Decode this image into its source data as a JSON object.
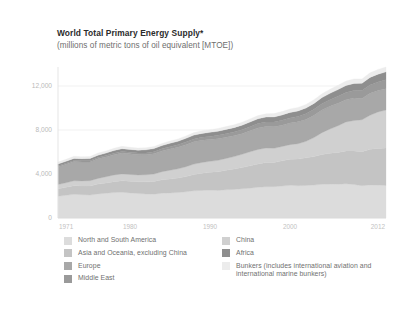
{
  "title": "World Total Primary Energy Supply*",
  "subtitle": "(millions of metric tons of oil equivalent [MTOE])",
  "legend": {
    "left": [
      {
        "label": "North and South America",
        "color": "#dcdcdc"
      },
      {
        "label": "Asia and Oceania, excluding China",
        "color": "#c4c4c4"
      },
      {
        "label": "Europe",
        "color": "#a8a8a8"
      },
      {
        "label": "Middle East",
        "color": "#9a9a9a"
      }
    ],
    "right": [
      {
        "label": "China",
        "color": "#d0d0d0"
      },
      {
        "label": "Africa",
        "color": "#8e8e8e"
      },
      {
        "label": "Bunkers (includes international aviation and international marine bunkers)",
        "color": "#ececec"
      }
    ]
  },
  "chart_data": {
    "type": "area",
    "stacked": true,
    "title": "World Total Primary Energy Supply*",
    "subtitle": "(millions of metric tons of oil equivalent [MTOE])",
    "xlabel": "",
    "ylabel": "",
    "ylim": [
      0,
      13000
    ],
    "yticks": [
      0,
      4000,
      8000,
      12000
    ],
    "ytick_labels": [
      "0",
      "4,000",
      "8,000",
      "12,000"
    ],
    "xlim": [
      1971,
      2012
    ],
    "xticks": [
      1971,
      1980,
      1990,
      2000,
      2012
    ],
    "xtick_labels": [
      "1971",
      "1980",
      "1990",
      "2000",
      "2012"
    ],
    "grid": "horizontal",
    "legend_position": "bottom",
    "x": [
      1971,
      1972,
      1973,
      1974,
      1975,
      1976,
      1977,
      1978,
      1979,
      1980,
      1981,
      1982,
      1983,
      1984,
      1985,
      1986,
      1987,
      1988,
      1989,
      1990,
      1991,
      1992,
      1993,
      1994,
      1995,
      1996,
      1997,
      1998,
      1999,
      2000,
      2001,
      2002,
      2003,
      2004,
      2005,
      2006,
      2007,
      2008,
      2009,
      2010,
      2011,
      2012
    ],
    "series": [
      {
        "name": "North and South America",
        "color": "#dcdcdc",
        "values": [
          1980,
          2060,
          2150,
          2120,
          2080,
          2190,
          2250,
          2310,
          2340,
          2280,
          2220,
          2180,
          2170,
          2250,
          2280,
          2310,
          2380,
          2470,
          2510,
          2530,
          2510,
          2560,
          2600,
          2660,
          2710,
          2790,
          2840,
          2850,
          2900,
          2970,
          2930,
          2960,
          2990,
          3060,
          3080,
          3070,
          3110,
          3050,
          2930,
          3010,
          2990,
          2960
        ]
      },
      {
        "name": "Asia and Oceania, excluding China",
        "color": "#c4c4c4",
        "values": [
          680,
          730,
          790,
          800,
          830,
          890,
          940,
          990,
          1040,
          1060,
          1080,
          1110,
          1150,
          1220,
          1270,
          1320,
          1390,
          1480,
          1560,
          1630,
          1700,
          1780,
          1850,
          1930,
          2030,
          2130,
          2210,
          2200,
          2300,
          2380,
          2430,
          2510,
          2600,
          2720,
          2810,
          2890,
          2990,
          3050,
          3100,
          3250,
          3330,
          3400
        ]
      },
      {
        "name": "China",
        "color": "#d0d0d0",
        "values": [
          390,
          410,
          440,
          450,
          480,
          520,
          560,
          610,
          630,
          620,
          610,
          640,
          680,
          740,
          790,
          840,
          890,
          950,
          980,
          990,
          1030,
          1080,
          1130,
          1200,
          1280,
          1310,
          1310,
          1290,
          1300,
          1320,
          1390,
          1500,
          1720,
          1980,
          2200,
          2420,
          2630,
          2760,
          2900,
          3080,
          3320,
          3450
        ]
      },
      {
        "name": "Europe",
        "color": "#a8a8a8",
        "values": [
          1620,
          1690,
          1760,
          1730,
          1700,
          1780,
          1800,
          1850,
          1900,
          1870,
          1830,
          1820,
          1840,
          1880,
          1930,
          1960,
          2010,
          2030,
          2010,
          1980,
          1970,
          1930,
          1900,
          1880,
          1910,
          1960,
          1950,
          1950,
          1940,
          1960,
          1990,
          1990,
          2030,
          2050,
          2060,
          2060,
          2030,
          2040,
          1940,
          2010,
          1960,
          1950
        ]
      },
      {
        "name": "Middle East",
        "color": "#9a9a9a",
        "values": [
          70,
          80,
          90,
          95,
          105,
          115,
          125,
          135,
          145,
          150,
          160,
          170,
          185,
          200,
          215,
          230,
          245,
          260,
          275,
          290,
          305,
          320,
          340,
          355,
          375,
          395,
          415,
          435,
          450,
          470,
          490,
          515,
          540,
          570,
          600,
          630,
          660,
          690,
          710,
          740,
          770,
          800
        ]
      },
      {
        "name": "Africa",
        "color": "#8e8e8e",
        "values": [
          170,
          180,
          190,
          195,
          205,
          215,
          225,
          240,
          250,
          255,
          265,
          275,
          285,
          295,
          305,
          315,
          330,
          345,
          355,
          365,
          375,
          385,
          395,
          410,
          420,
          435,
          450,
          460,
          475,
          490,
          505,
          520,
          540,
          565,
          585,
          605,
          625,
          645,
          665,
          690,
          705,
          725
        ]
      },
      {
        "name": "Bunkers (includes international aviation and international marine bunkers)",
        "color": "#ececec",
        "values": [
          170,
          180,
          190,
          185,
          180,
          190,
          195,
          205,
          210,
          200,
          195,
          190,
          190,
          195,
          200,
          210,
          220,
          230,
          240,
          245,
          250,
          255,
          260,
          270,
          280,
          290,
          300,
          305,
          310,
          320,
          320,
          325,
          335,
          355,
          370,
          385,
          400,
          405,
          395,
          420,
          430,
          440
        ]
      }
    ]
  }
}
